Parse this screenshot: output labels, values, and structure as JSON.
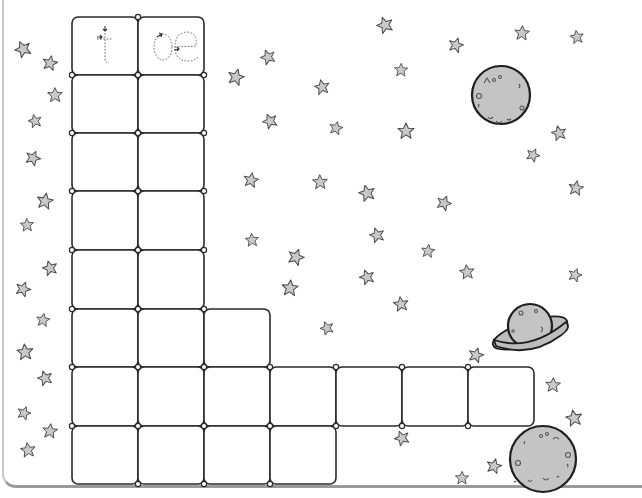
{
  "worksheet": {
    "title_cells": [
      {
        "text": "t",
        "style": "dotted-tracing",
        "has_stroke_arrows": true
      },
      {
        "text": "oe",
        "style": "dotted-tracing",
        "has_stroke_arrows": true
      }
    ],
    "grid": {
      "description": "L-shaped crossword-style writing grid",
      "rows": [
        {
          "row": 1,
          "cells": [
            {
              "col": 1,
              "content": "t"
            },
            {
              "col": 2,
              "content": "oe"
            }
          ]
        },
        {
          "row": 2,
          "cells": [
            {
              "col": 1,
              "content": ""
            },
            {
              "col": 2,
              "content": ""
            }
          ]
        },
        {
          "row": 3,
          "cells": [
            {
              "col": 1,
              "content": ""
            },
            {
              "col": 2,
              "content": ""
            }
          ]
        },
        {
          "row": 4,
          "cells": [
            {
              "col": 1,
              "content": ""
            },
            {
              "col": 2,
              "content": ""
            }
          ]
        },
        {
          "row": 5,
          "cells": [
            {
              "col": 1,
              "content": ""
            },
            {
              "col": 2,
              "content": ""
            }
          ]
        },
        {
          "row": 6,
          "cells": [
            {
              "col": 1,
              "content": ""
            },
            {
              "col": 2,
              "content": ""
            },
            {
              "col": 3,
              "content": ""
            }
          ]
        },
        {
          "row": 7,
          "cells": [
            {
              "col": 1,
              "content": ""
            },
            {
              "col": 2,
              "content": ""
            },
            {
              "col": 3,
              "content": ""
            },
            {
              "col": 4,
              "content": ""
            },
            {
              "col": 5,
              "content": ""
            },
            {
              "col": 6,
              "content": ""
            },
            {
              "col": 7,
              "content": ""
            }
          ]
        },
        {
          "row": 8,
          "cells": [
            {
              "col": 1,
              "content": ""
            },
            {
              "col": 2,
              "content": ""
            },
            {
              "col": 3,
              "content": ""
            },
            {
              "col": 4,
              "content": ""
            }
          ]
        }
      ]
    },
    "decorations": {
      "theme": "outer-space",
      "star_icon": "star-icon",
      "planets": [
        {
          "name": "moon-top-right",
          "icon": "moon-icon"
        },
        {
          "name": "ringed-planet",
          "icon": "saturn-icon"
        },
        {
          "name": "moon-bottom-right",
          "icon": "moon-icon"
        }
      ],
      "colors": {
        "star_fill": "#c9c9c9",
        "planet_fill": "#c4c4c4",
        "outline": "#2a2a2a",
        "background": "#ffffff"
      }
    }
  }
}
